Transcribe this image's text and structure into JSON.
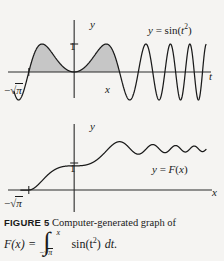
{
  "figure": {
    "label": "FIGURE 5",
    "caption_text": "Computer-generated graph of",
    "formula": {
      "lhs": "F(x)",
      "equals": "=",
      "integral_lower": "−√π",
      "integral_lower_minus": "−",
      "integral_lower_radicand": "π",
      "integral_upper": "x",
      "integrand": "sin(t",
      "integrand_exp": "2",
      "integrand_close": ")",
      "differential": "dt."
    }
  },
  "colors": {
    "background": "#f5f4f2",
    "ink": "#1a1a1a",
    "shade": "#c6c6c6",
    "axis": "#2a2a2a"
  },
  "chart_data": [
    {
      "id": "top",
      "type": "line",
      "title": "",
      "curve_label": "y = sin(t²)",
      "curve_label_parts": {
        "y": "y",
        "eq": "=",
        "fn": "sin(",
        "var": "t",
        "exp": "2",
        "close": ")"
      },
      "xlabel": "t",
      "ylabel": "y",
      "ytick_labels": [
        "1"
      ],
      "yticks": [
        1
      ],
      "xtick_labels": [
        "−√π",
        "x"
      ],
      "xtick_minus": "−",
      "xtick_radicand": "π",
      "xtick_x": "x",
      "xticks": [
        -1.7724539,
        1.7724539
      ],
      "xlim": [
        -2.35,
        5.15
      ],
      "ylim": [
        -1.35,
        1.35
      ],
      "grid": false,
      "legend": "none",
      "function": "sin(t^2)",
      "shaded_region": {
        "from": -1.7724539,
        "to": 1.7724539,
        "fill": "#c6c6c6",
        "description": "area under y = sin(t^2) from -sqrt(pi) to x"
      },
      "samples_note": "y = sin(t^2) sampled over t in [-2.35, 5.15]"
    },
    {
      "id": "bottom",
      "type": "line",
      "title": "",
      "curve_label": "y = F(x)",
      "curve_label_parts": {
        "y": "y",
        "eq": "=",
        "fn": "F",
        "open": "(",
        "var": "x",
        "close": ")"
      },
      "xlabel": "x",
      "ylabel": "y",
      "ytick_labels": [
        "1"
      ],
      "yticks": [
        1
      ],
      "xtick_labels": [
        "−√π"
      ],
      "xtick_minus": "−",
      "xtick_radicand": "π",
      "xticks": [
        -1.7724539
      ],
      "xlim": [
        -2.35,
        5.15
      ],
      "ylim": [
        -0.45,
        1.95
      ],
      "grid": false,
      "legend": "none",
      "function": "F(x) = integral from -sqrt(pi) to x of sin(t^2) dt",
      "samples_note": "Fresnel-type antiderivative, rises to ~1 near x=0 then damped oscillation toward ~1.55"
    }
  ]
}
